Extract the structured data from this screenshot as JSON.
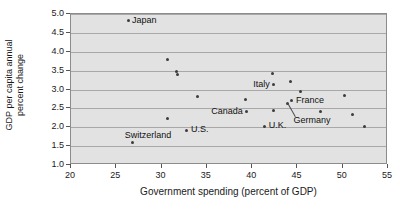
{
  "chart_data": {
    "type": "scatter",
    "title": "",
    "xlabel": "Government spending (percent of GDP)",
    "ylabel": "GDP per capita annual percent change",
    "ylabel_line1": "GDP per capita annual",
    "ylabel_line2": "percent change",
    "xlim": [
      20,
      55
    ],
    "ylim": [
      1.0,
      5.0
    ],
    "xticks": [
      "20",
      "25",
      "30",
      "35",
      "40",
      "45",
      "50",
      "55"
    ],
    "xtick_values": [
      20,
      25,
      30,
      35,
      40,
      45,
      50,
      55
    ],
    "yticks": [
      "1.0",
      "1.5",
      "2.0",
      "2.5",
      "3.0",
      "3.5",
      "4.0",
      "4.5",
      "5.0"
    ],
    "ytick_values": [
      1.0,
      1.5,
      2.0,
      2.5,
      3.0,
      3.5,
      4.0,
      4.5,
      5.0
    ],
    "grid": true,
    "grid_axis": "y",
    "legend": false,
    "marker_color": "#3c3c3c",
    "plot_background": "#e2e2e2",
    "gridline_color": "#a8a8a8",
    "points": [
      {
        "x": 26.3,
        "y": 4.82,
        "label": "Japan",
        "label_pos": "right"
      },
      {
        "x": 26.8,
        "y": 1.6,
        "label": "",
        "label_pos": ""
      },
      {
        "x": 30.6,
        "y": 3.79,
        "label": "",
        "label_pos": ""
      },
      {
        "x": 30.7,
        "y": 2.23,
        "label": "",
        "label_pos": ""
      },
      {
        "x": 31.6,
        "y": 3.47,
        "label": "",
        "label_pos": ""
      },
      {
        "x": 31.8,
        "y": 3.4,
        "label": "",
        "label_pos": ""
      },
      {
        "x": 32.8,
        "y": 1.92,
        "label": "U.S.",
        "label_pos": "right"
      },
      {
        "x": 34.0,
        "y": 2.82,
        "label": "",
        "label_pos": ""
      },
      {
        "x": 39.3,
        "y": 2.73,
        "label": "",
        "label_pos": ""
      },
      {
        "x": 39.4,
        "y": 2.41,
        "label": "Canada",
        "label_pos": "left"
      },
      {
        "x": 41.4,
        "y": 2.02,
        "label": "U.K.",
        "label_pos": "right"
      },
      {
        "x": 42.2,
        "y": 3.42,
        "label": "",
        "label_pos": ""
      },
      {
        "x": 42.4,
        "y": 3.13,
        "label": "Italy",
        "label_pos": "left"
      },
      {
        "x": 42.4,
        "y": 2.45,
        "label": "",
        "label_pos": ""
      },
      {
        "x": 43.9,
        "y": 2.64,
        "label": "Germany",
        "label_pos": "leader"
      },
      {
        "x": 44.2,
        "y": 3.22,
        "label": "",
        "label_pos": ""
      },
      {
        "x": 44.4,
        "y": 2.7,
        "label": "France",
        "label_pos": "right"
      },
      {
        "x": 45.3,
        "y": 2.95,
        "label": "",
        "label_pos": ""
      },
      {
        "x": 47.5,
        "y": 2.43,
        "label": "",
        "label_pos": ""
      },
      {
        "x": 50.2,
        "y": 2.83,
        "label": "",
        "label_pos": ""
      },
      {
        "x": 51.1,
        "y": 2.34,
        "label": "",
        "label_pos": ""
      },
      {
        "x": 52.4,
        "y": 2.02,
        "label": "",
        "label_pos": ""
      }
    ],
    "annotations": [
      {
        "text": "Switzerland",
        "x": 28.5,
        "y": 1.78,
        "anchor": "center"
      }
    ]
  }
}
